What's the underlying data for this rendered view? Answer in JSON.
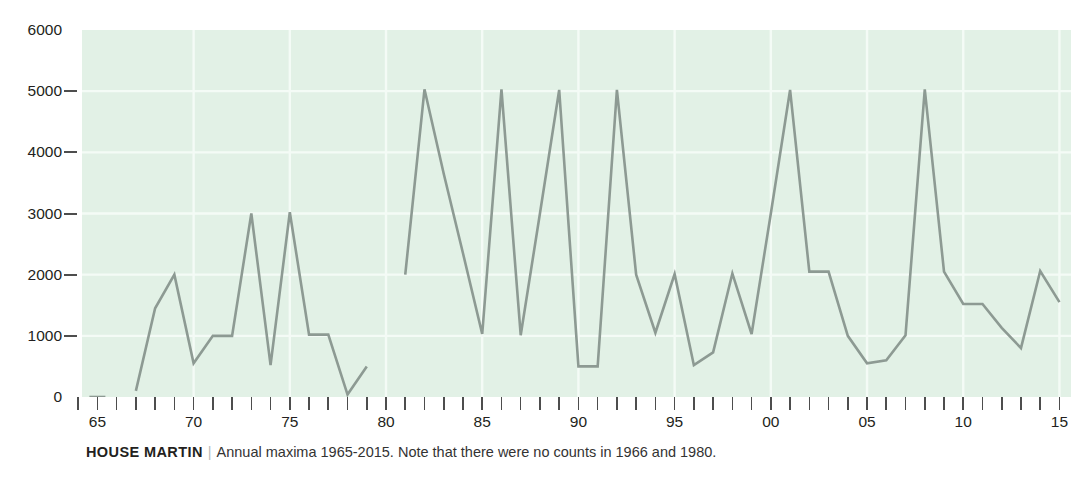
{
  "caption": {
    "species": "HOUSE MARTIN",
    "divider": "|",
    "note": "Annual maxima 1965-2015. Note that there were no counts in 1966 and 1980."
  },
  "colors": {
    "plot_background": "#e2f1e6",
    "gridline": "#f4fbf6",
    "line": "#8d9a93",
    "axis": "#4d4d4d",
    "text": "#231f20"
  },
  "chart_data": {
    "type": "line",
    "title": "HOUSE MARTIN",
    "subtitle": "Annual maxima 1965-2015. Note that there were no counts in 1966 and 1980.",
    "xlabel": "",
    "ylabel": "",
    "ylim": [
      0,
      6000
    ],
    "xlim": [
      1964.2,
      2015.6
    ],
    "grid": true,
    "legend": false,
    "ytick_labels": [
      "6000",
      "5000",
      "4000",
      "3000",
      "2000",
      "1000",
      "0"
    ],
    "ytick_values": [
      6000,
      5000,
      4000,
      3000,
      2000,
      1000,
      0
    ],
    "xtick_labels": [
      "65",
      "70",
      "75",
      "80",
      "85",
      "90",
      "95",
      "00",
      "05",
      "10",
      "15"
    ],
    "xtick_values": [
      1965,
      1970,
      1975,
      1980,
      1985,
      1990,
      1995,
      2000,
      2005,
      2010,
      2015
    ],
    "xtick_minor_values": [
      1964,
      1966,
      1967,
      1968,
      1969,
      1971,
      1972,
      1973,
      1974,
      1976,
      1977,
      1978,
      1979,
      1981,
      1982,
      1983,
      1984,
      1986,
      1987,
      1988,
      1989,
      1991,
      1992,
      1993,
      1994,
      1996,
      1997,
      1998,
      1999,
      2001,
      2002,
      2003,
      2004,
      2006,
      2007,
      2008,
      2009,
      2011,
      2012,
      2013,
      2014
    ],
    "x": [
      1965,
      1967,
      1968,
      1969,
      1970,
      1971,
      1972,
      1973,
      1974,
      1975,
      1976,
      1977,
      1978,
      1979,
      1981,
      1982,
      1983,
      1984,
      1985,
      1986,
      1987,
      1988,
      1989,
      1990,
      1991,
      1992,
      1993,
      1994,
      1995,
      1996,
      1997,
      1998,
      1999,
      2000,
      2001,
      2002,
      2003,
      2004,
      2005,
      2006,
      2007,
      2008,
      2009,
      2010,
      2011,
      2012,
      2013,
      2014,
      2015
    ],
    "values": [
      0,
      100,
      1450,
      2000,
      550,
      1000,
      1000,
      3000,
      520,
      3020,
      1020,
      1020,
      40,
      500,
      2000,
      5030,
      3650,
      2350,
      1030,
      5030,
      1010,
      3000,
      5020,
      500,
      500,
      5020,
      2000,
      1050,
      2010,
      520,
      730,
      2020,
      1030,
      3000,
      5020,
      2050,
      2050,
      1000,
      550,
      600,
      1010,
      5030,
      2050,
      1520,
      1520,
      1130,
      800,
      2060,
      1550
    ],
    "series_breaks": [
      [
        1965,
        1965
      ],
      [
        1967,
        1979
      ],
      [
        1981,
        2015
      ]
    ],
    "missing_years": [
      1966,
      1980
    ]
  }
}
